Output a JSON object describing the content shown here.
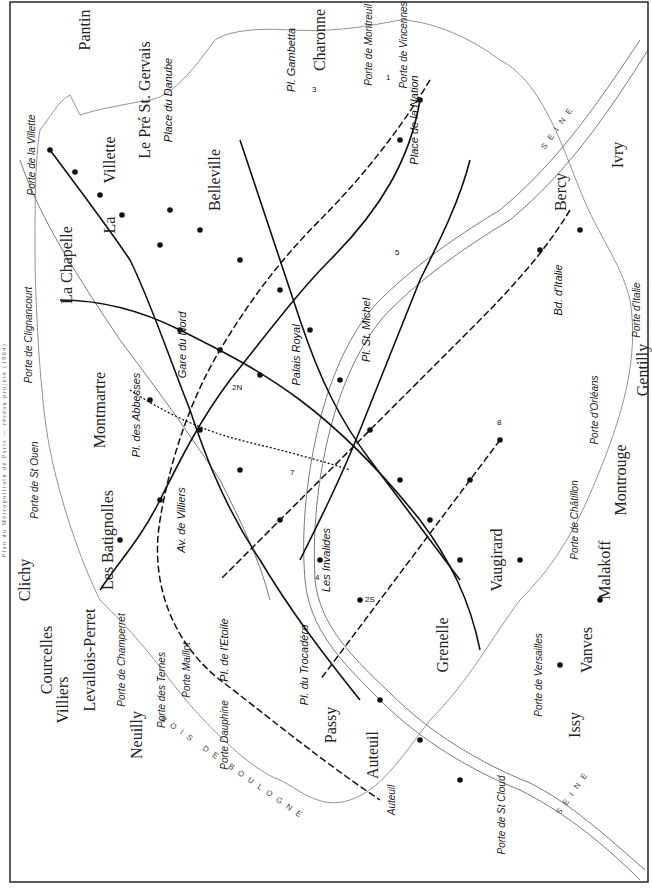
{
  "caption": "Plan du Métropolitain de Paris — réseau projeté (1904)",
  "districts": [
    {
      "id": "pantin",
      "label": "Pantin"
    },
    {
      "id": "pre_st_gervais",
      "label": "Le Pré St. Gervais"
    },
    {
      "id": "la_villette",
      "label": "Villette"
    },
    {
      "id": "la",
      "label": "La"
    },
    {
      "id": "la_chapelle",
      "label": "La Chapelle"
    },
    {
      "id": "belleville",
      "label": "Belleville"
    },
    {
      "id": "charonne",
      "label": "Charonne"
    },
    {
      "id": "montmartre",
      "label": "Montmartre"
    },
    {
      "id": "clichy",
      "label": "Clichy"
    },
    {
      "id": "batignolles",
      "label": "Les Batignolles"
    },
    {
      "id": "courcelles",
      "label": "Courcelles"
    },
    {
      "id": "levallois",
      "label": "Levallois-Perret"
    },
    {
      "id": "villiers",
      "label": "Villiers"
    },
    {
      "id": "neuilly",
      "label": "Neuilly"
    },
    {
      "id": "passy",
      "label": "Passy"
    },
    {
      "id": "auteuil",
      "label": "Auteuil"
    },
    {
      "id": "grenelle",
      "label": "Grenelle"
    },
    {
      "id": "vaugirard",
      "label": "Vaugirard"
    },
    {
      "id": "issy",
      "label": "Issy"
    },
    {
      "id": "vanves",
      "label": "Vanves"
    },
    {
      "id": "malakoff",
      "label": "Malakoff"
    },
    {
      "id": "montrouge",
      "label": "Montrouge"
    },
    {
      "id": "gentilly",
      "label": "Gentilly"
    },
    {
      "id": "bercy",
      "label": "Bercy"
    },
    {
      "id": "ivry",
      "label": "Ivry"
    }
  ],
  "portes": [
    {
      "id": "villette",
      "label": "Porte de la Villette"
    },
    {
      "id": "clignancourt",
      "label": "Porte de Clignancourt"
    },
    {
      "id": "st_ouen",
      "label": "Porte de St Ouen"
    },
    {
      "id": "champerret",
      "label": "Porte de Champerret"
    },
    {
      "id": "ternes",
      "label": "Porte des Ternes"
    },
    {
      "id": "maillot",
      "label": "Porte Maillot"
    },
    {
      "id": "dauphine",
      "label": "Porte Dauphine"
    },
    {
      "id": "auteuil",
      "label": "Auteuil"
    },
    {
      "id": "st_cloud",
      "label": "Porte de St Cloud"
    },
    {
      "id": "versailles",
      "label": "Porte de Versailles"
    },
    {
      "id": "chatillon",
      "label": "Porte de Châtillon"
    },
    {
      "id": "orleans",
      "label": "Porte d'Orléans"
    },
    {
      "id": "italie",
      "label": "Porte d'Italie"
    },
    {
      "id": "vincennes",
      "label": "Porte de Vincennes"
    },
    {
      "id": "montreuil",
      "label": "Porte de Montreuil"
    }
  ],
  "hubs": [
    {
      "id": "place_nation",
      "label": "Place de la Nation"
    },
    {
      "id": "pl_gambetta",
      "label": "Pl. Gambetta"
    },
    {
      "id": "pl_danube",
      "label": "Place du Danube"
    },
    {
      "id": "gare_nord",
      "label": "Gare du Nord"
    },
    {
      "id": "pl_abbesses",
      "label": "Pl. des Abbesses"
    },
    {
      "id": "palais_royal",
      "label": "Palais Royal"
    },
    {
      "id": "pl_st_michel",
      "label": "Pl. St. Michel"
    },
    {
      "id": "invalides",
      "label": "Les Invalides"
    },
    {
      "id": "av_villiers",
      "label": "Av. de Villiers"
    },
    {
      "id": "pl_etoile",
      "label": "Pl. de l'Etoile"
    },
    {
      "id": "pl_trocadero",
      "label": "Pl. du Trocadéro"
    },
    {
      "id": "bd_italie",
      "label": "Bd. d'Italie"
    }
  ],
  "stations": [
    "Porte de Pantin",
    "R. de Crimée",
    "R. Riquet",
    "R. d'Aubervilliers",
    "R. de la Chapelle",
    "R. de Allemagne",
    "R. Bolivar",
    "Butte Chaumont",
    "R. de Simplon",
    "R. Marcadet",
    "Château Rouge",
    "Gare de l'Est",
    "R. de Château Landon",
    "R. Louis Blanc",
    "Pl. de la République",
    "R. de Belleville",
    "R. des Couronnes",
    "R. de Ménilmontant",
    "Pl. Martin Nadaud",
    "Père Lachaise",
    "R. St. Maur",
    "Av. Parmentier",
    "Pl. Voltaire",
    "R. de Charonne",
    "Av. Philippe-Auguste",
    "R. de Bagnolet",
    "Bd. de Charonne",
    "R. des Pyrénées",
    "R. St. Fargeau",
    "R. Pelleport",
    "R. du Borrégo",
    "Pl. des Fêtes",
    "R. de la Bastille",
    "R. de Lyon",
    "Gare de Lyon",
    "Pl. Mazas",
    "Pont d'Austerlitz",
    "Gare d'Orléans",
    "Bd. St. Marcel",
    "Les Gobelins",
    "Pl. Monge",
    "R. de la Glacière",
    "R. St. Jacques",
    "Pl. Denfert-Rochereau",
    "R. d'Alésia",
    "R. Mouton-Duvernet",
    "R. de Vaugirard",
    "Bd. Pasteur",
    "R. de Sèvres",
    "Av. de Suffren",
    "R. de Grenelle",
    "Ecole Militaire",
    "Av. Bosquet",
    "Av. de la Motte-Picquet",
    "Pl. Cambronne",
    "R. de Passy",
    "Quai de Passy",
    "R. de la Pompe",
    "Pl. Victor-Hugo",
    "R. Boissière",
    "Av. Kléber",
    "Av. d'Iéna",
    "Av. Marceau",
    "Champs Élysées",
    "Pl. de la Concorde",
    "Tuileries",
    "Louvre",
    "Châtelet",
    "Hôtel de Ville",
    "R. St. Paul",
    "R. de Rivoli",
    "Opéra",
    "R. du 4 Septembre",
    "Bourse",
    "Pl. de la Madeleine",
    "Gare St. Lazare",
    "Pl. de l'Europe",
    "R. de Rome",
    "Pl. Clichy",
    "Pl. Blanche",
    "Pigalle",
    "Barbès",
    "R. La Bruyère",
    "R. Lamarck",
    "Av. de Clichy",
    "Av. de Wagram",
    "Pl. Malesherbes",
    "R. de Monceau",
    "R. de Courcelles",
    "Pl. des Ternes",
    "Av. de Neuilly",
    "R. Ranelagh",
    "R. Jasmin",
    "R. d'Auteuil",
    "R. Mirabeau",
    "R. Michel-Ange",
    "R. Molitor",
    "R. Chardon-Lagache",
    "Pont Mirabeau",
    "Av. de Versailles",
    "R. de Tolbiac",
    "La Maison Blanche",
    "R. Nationale",
    "Bd. de la Gare",
    "R. de Chevaleret",
    "Quai de la Rapée",
    "R. de Reuilly",
    "R. de Bercy",
    "R. Daumesnil",
    "R. de Charenton",
    "Bel-Air",
    "Av. de St. Mandé",
    "Bd. Diderot",
    "Gare de Lyon",
    "Pl. Mazas",
    "R. du Louvre",
    "Pl. St. Germain",
    "St. Germain des Prés",
    "St. Sulpice",
    "Luxembourg",
    "R. de Rennes",
    "Gare Montparnasse",
    "R. du Bac",
    "R. St. Dominique",
    "R. de l'Université",
    "R. de la Convention"
  ],
  "line_numbers": [
    "1",
    "2N",
    "2S",
    "3",
    "4",
    "5",
    "6",
    "7",
    "8",
    "9"
  ],
  "river": {
    "label": "SEINE"
  },
  "forest": {
    "label": "BOIS DE BOULOGNE"
  },
  "colors": {
    "ink": "#111111",
    "paper": "#ffffff",
    "boundary": "#777777",
    "river": "#555555"
  }
}
